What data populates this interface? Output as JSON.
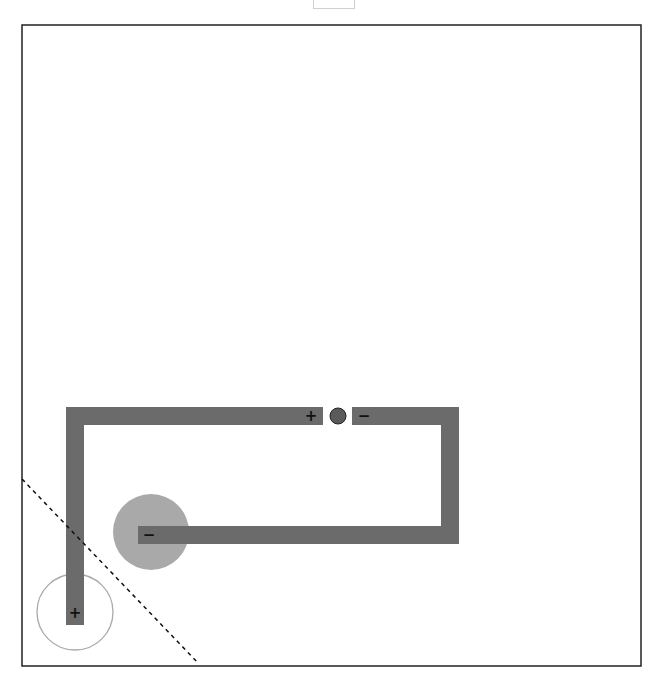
{
  "diagram": {
    "type": "circuit",
    "frame": {
      "x": 22,
      "y": 25,
      "width": 619,
      "height": 641,
      "stroke": "#222222"
    },
    "colors": {
      "wire": "#6b6b6b",
      "charge_fill": "#a9a9a9",
      "battery": "#5a5a5a",
      "outline": "#aaaaaa",
      "sign": "#111111"
    },
    "terminals": {
      "battery_positive": "+",
      "battery_negative": "−",
      "lower_wire_end": "−",
      "left_wire_end": "+"
    },
    "battery": {
      "cx": 338,
      "cy": 416,
      "r": 8
    },
    "filled_circle": {
      "cx": 151,
      "cy": 532,
      "r": 38
    },
    "outline_circle": {
      "cx": 75,
      "cy": 612,
      "r": 38
    },
    "dashed_line": {
      "x1": 22,
      "y1": 479,
      "x2": 199,
      "y2": 664
    }
  }
}
